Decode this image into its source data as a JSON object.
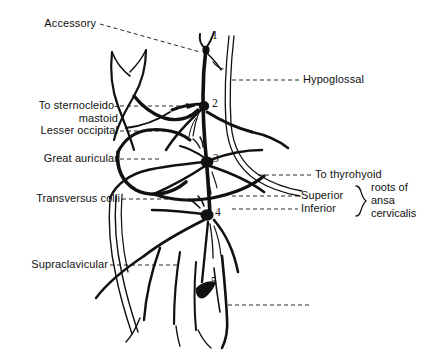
{
  "figure": {
    "ink_color": "#111111",
    "background": "#ffffff"
  },
  "labels": {
    "accessory": "Accessory",
    "to_sternocleido": "To sternocleido-",
    "mastoid": "mastoid",
    "lesser_occipital": "Lesser occipital",
    "great_auricular": "Great auricular",
    "transversus_colli": "Transversus colli",
    "supraclavicular": "Supraclavicular",
    "hypoglossal": "Hypoglossal",
    "to_thyrohyoid": "To thyrohyoid",
    "superior": "Superior",
    "inferior": "Inferior",
    "brace_line1": "roots of",
    "brace_line2": "ansa",
    "brace_line3": "cervicalis"
  },
  "nodes": {
    "n1": "1",
    "n2": "2",
    "n3": "3",
    "n4": "4",
    "n5": "5"
  }
}
